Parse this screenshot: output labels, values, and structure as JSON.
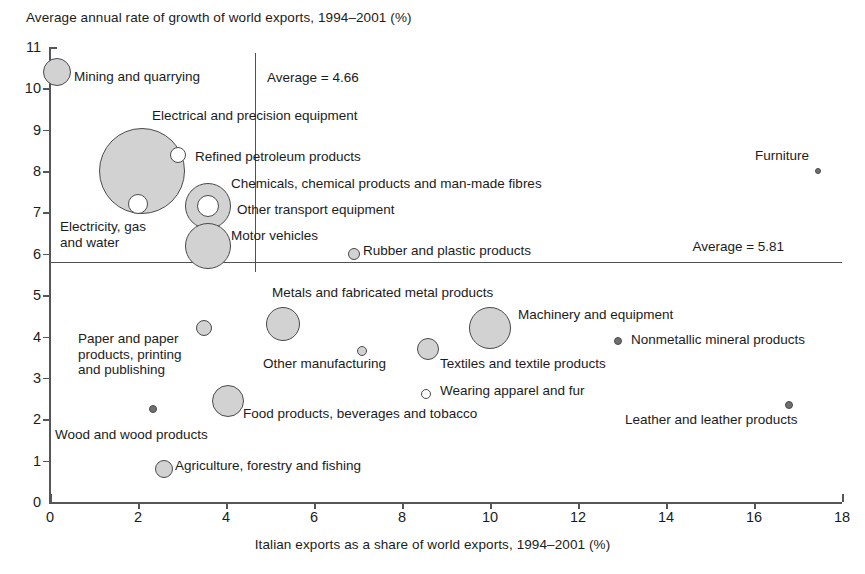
{
  "chart_data": {
    "type": "scatter",
    "title": "Average annual rate of growth of world exports, 1994–2001 (%)",
    "xlabel": "Italian exports as a share of world exports, 1994–2001 (%)",
    "ylabel": "Average annual rate of growth of world exports, 1994–2001 (%)",
    "xlim": [
      0,
      18
    ],
    "ylim": [
      0,
      11
    ],
    "xticks": [
      "0",
      "2",
      "4",
      "6",
      "8",
      "10",
      "12",
      "14",
      "16",
      "18"
    ],
    "yticks": [
      "0",
      "1",
      "2",
      "3",
      "4",
      "5",
      "6",
      "7",
      "8",
      "9",
      "10",
      "11"
    ],
    "grid": false,
    "legend": "none",
    "bubble_note": "Bubble area is proportional to the sector's share of Italian exports",
    "reference_lines": [
      {
        "id": "x-average",
        "orientation": "vertical",
        "value": 4.66,
        "label": "Average = 4.66"
      },
      {
        "id": "y-average",
        "orientation": "horizontal",
        "value": 5.81,
        "label": "Average = 5.81"
      }
    ],
    "points": [
      {
        "label": "Mining and quarrying",
        "x": 0.15,
        "y": 10.4,
        "r": 14,
        "style": "filled"
      },
      {
        "label": "Electricity, gas\nand water",
        "x": 2.1,
        "y": 8.0,
        "r": 43,
        "style": "filled"
      },
      {
        "label": "Electrical and precision equipment",
        "x": 2.9,
        "y": 8.4,
        "r": 8,
        "style": "hollow"
      },
      {
        "label": "Refined petroleum products",
        "x": 2.0,
        "y": 7.2,
        "r": 10,
        "style": "hollow"
      },
      {
        "label": "Chemicals, chemical products and man-made fibres",
        "x": 3.6,
        "y": 7.15,
        "r": 23,
        "style": "filled"
      },
      {
        "label": "Other transport equipment",
        "x": 3.6,
        "y": 7.15,
        "r": 11,
        "style": "hollow"
      },
      {
        "label": "Motor vehicles",
        "x": 3.6,
        "y": 6.2,
        "r": 23,
        "style": "filled"
      },
      {
        "label": "Rubber and plastic products",
        "x": 6.9,
        "y": 6.0,
        "r": 6,
        "style": "filled"
      },
      {
        "label": "Furniture",
        "x": 17.45,
        "y": 8.0,
        "r": 3,
        "style": "tiny"
      },
      {
        "label": "Metals and fabricated metal products",
        "x": 5.3,
        "y": 4.3,
        "r": 17,
        "style": "filled"
      },
      {
        "label": "Machinery and equipment",
        "x": 10.0,
        "y": 4.2,
        "r": 21,
        "style": "filled"
      },
      {
        "label": "Paper and paper\nproducts, printing\nand publishing",
        "x": 3.5,
        "y": 4.2,
        "r": 8,
        "style": "filled"
      },
      {
        "label": "Other manufacturing",
        "x": 7.1,
        "y": 3.65,
        "r": 5,
        "style": "filled"
      },
      {
        "label": "Textiles and textile products",
        "x": 8.6,
        "y": 3.7,
        "r": 11,
        "style": "filled"
      },
      {
        "label": "Nonmetallic mineral products",
        "x": 12.9,
        "y": 3.9,
        "r": 4,
        "style": "tiny"
      },
      {
        "label": "Wearing apparel and fur",
        "x": 8.55,
        "y": 2.6,
        "r": 5,
        "style": "hollow"
      },
      {
        "label": "Food products, beverages and tobacco",
        "x": 4.05,
        "y": 2.45,
        "r": 16,
        "style": "filled"
      },
      {
        "label": "Leather and leather products",
        "x": 16.8,
        "y": 2.35,
        "r": 4,
        "style": "tiny"
      },
      {
        "label": "Wood and wood products",
        "x": 2.35,
        "y": 2.25,
        "r": 4,
        "style": "tiny"
      },
      {
        "label": "Agriculture, forestry and fishing",
        "x": 2.6,
        "y": 0.8,
        "r": 9,
        "style": "filled"
      }
    ],
    "annotations": [
      {
        "id": "ann-mining",
        "text": "Mining and quarrying",
        "left": 74,
        "top": 69,
        "lines": 1
      },
      {
        "id": "ann-electrical",
        "text": "Electrical and precision equipment",
        "left": 152,
        "top": 108,
        "lines": 1
      },
      {
        "id": "ann-refined",
        "text": "Refined petroleum products",
        "left": 195,
        "top": 149,
        "lines": 1
      },
      {
        "id": "ann-chemicals",
        "text": "Chemicals, chemical products and man-made fibres",
        "left": 231,
        "top": 176,
        "lines": 1
      },
      {
        "id": "ann-othertransport",
        "text": "Other transport equipment",
        "left": 237,
        "top": 202,
        "lines": 1
      },
      {
        "id": "ann-motor",
        "text": "Motor vehicles",
        "left": 231,
        "top": 228,
        "lines": 1
      },
      {
        "id": "ann-electricity",
        "text": "Electricity, gas\nand water",
        "left": 60,
        "top": 219,
        "lines": 2
      },
      {
        "id": "ann-rubber",
        "text": "Rubber and plastic products",
        "left": 363,
        "top": 243,
        "lines": 1
      },
      {
        "id": "ann-furniture",
        "text": "Furniture",
        "left": 755,
        "top": 148,
        "lines": 1
      },
      {
        "id": "ann-metals",
        "text": "Metals and fabricated metal products",
        "left": 272,
        "top": 285,
        "lines": 1
      },
      {
        "id": "ann-machinery",
        "text": "Machinery and equipment",
        "left": 518,
        "top": 307,
        "lines": 1
      },
      {
        "id": "ann-paper",
        "text": "Paper and paper\nproducts, printing\nand publishing",
        "left": 78,
        "top": 331,
        "lines": 3
      },
      {
        "id": "ann-othermanuf",
        "text": "Other manufacturing",
        "left": 263,
        "top": 356,
        "lines": 1
      },
      {
        "id": "ann-nonmetallic",
        "text": "Nonmetallic mineral products",
        "left": 631,
        "top": 332,
        "lines": 1
      },
      {
        "id": "ann-textiles",
        "text": "Textiles and textile products",
        "left": 440,
        "top": 356,
        "lines": 1
      },
      {
        "id": "ann-wearing",
        "text": "Wearing apparel and fur",
        "left": 440,
        "top": 383,
        "lines": 1
      },
      {
        "id": "ann-food",
        "text": "Food products, beverages and tobacco",
        "left": 243,
        "top": 406,
        "lines": 1
      },
      {
        "id": "ann-leather",
        "text": "Leather and leather products",
        "left": 625,
        "top": 412,
        "lines": 1
      },
      {
        "id": "ann-wood",
        "text": "Wood and wood products",
        "left": 55,
        "top": 427,
        "lines": 1
      },
      {
        "id": "ann-agriculture",
        "text": "Agriculture, forestry and fishing",
        "left": 175,
        "top": 458,
        "lines": 1
      }
    ]
  },
  "colors": {
    "bubble_fill": "#d2d2d2",
    "bubble_stroke": "#4a4a4a",
    "axis": "#55565a",
    "text": "#1b1b1b",
    "background": "#ffffff"
  }
}
